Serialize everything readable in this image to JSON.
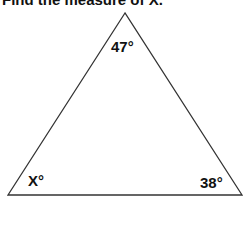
{
  "title": "Find the measure of X.",
  "triangle": {
    "vertices": {
      "top": [
        125,
        13
      ],
      "bottom_left": [
        8,
        195
      ],
      "bottom_right": [
        242,
        195
      ]
    },
    "stroke_color": "#333333"
  },
  "angles": {
    "top": "47°",
    "bottom_left": "X°",
    "bottom_right": "38°"
  }
}
